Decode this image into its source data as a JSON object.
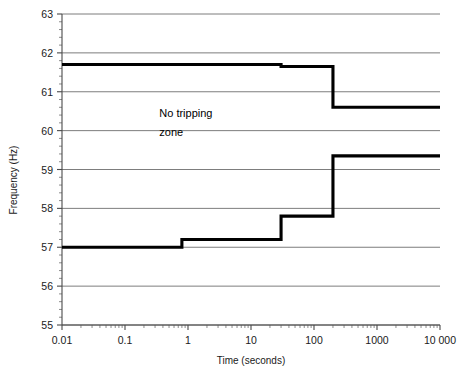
{
  "chart_data": {
    "type": "line",
    "title": "",
    "xlabel": "Time (seconds)",
    "ylabel": "Frequency (Hz)",
    "xscale": "log",
    "yscale": "linear",
    "xlim": [
      0.01,
      10000
    ],
    "ylim": [
      55,
      63
    ],
    "grid": true,
    "legend": false,
    "xticklabels": [
      "0.01",
      "0.1",
      "1",
      "10",
      "100",
      "1000",
      "10 000"
    ],
    "xtickvalues": [
      0.01,
      0.1,
      1,
      10,
      100,
      1000,
      10000
    ],
    "yticklabels": [
      "55",
      "56",
      "57",
      "58",
      "59",
      "60",
      "61",
      "62",
      "63"
    ],
    "ytickvalues": [
      55,
      56,
      57,
      58,
      59,
      60,
      61,
      62,
      63
    ],
    "annotations": [
      {
        "text": "No tripping",
        "x": 0.35,
        "y": 60.35
      },
      {
        "text": "zone",
        "x": 0.35,
        "y": 59.85
      }
    ],
    "series": [
      {
        "name": "Upper trip boundary",
        "step": "post",
        "points": [
          {
            "x": 0.01,
            "y": 61.7
          },
          {
            "x": 30,
            "y": 61.7
          },
          {
            "x": 30,
            "y": 61.65
          },
          {
            "x": 200,
            "y": 61.65
          },
          {
            "x": 200,
            "y": 60.6
          },
          {
            "x": 10000,
            "y": 60.6
          }
        ]
      },
      {
        "name": "Lower trip boundary",
        "step": "post",
        "points": [
          {
            "x": 0.01,
            "y": 57.0
          },
          {
            "x": 0.8,
            "y": 57.0
          },
          {
            "x": 0.8,
            "y": 57.2
          },
          {
            "x": 30,
            "y": 57.2
          },
          {
            "x": 30,
            "y": 57.8
          },
          {
            "x": 200,
            "y": 57.8
          },
          {
            "x": 200,
            "y": 59.35
          },
          {
            "x": 10000,
            "y": 59.35
          }
        ]
      }
    ]
  }
}
